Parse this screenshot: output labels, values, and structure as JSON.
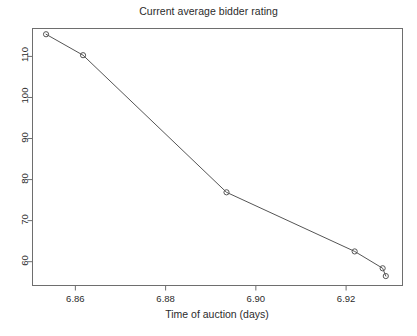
{
  "chart_data": {
    "type": "line",
    "title": "Current average bidder rating",
    "xlabel": "Time of auction (days)",
    "ylabel": "",
    "xlim": [
      6.8505,
      6.9325
    ],
    "ylim": [
      54.2,
      116.8
    ],
    "grid": false,
    "legend": null,
    "marker": "open-circle",
    "line_color": "#555555",
    "marker_color": "#555555",
    "x_ticks": [
      6.86,
      6.88,
      6.9,
      6.92
    ],
    "x_tick_labels": [
      "6.86",
      "6.88",
      "6.90",
      "6.92"
    ],
    "y_ticks": [
      60,
      70,
      80,
      90,
      100,
      110
    ],
    "y_tick_labels": [
      "60",
      "70",
      "80",
      "90",
      "100",
      "110"
    ],
    "series": [
      {
        "name": "Current average bidder rating",
        "x": [
          6.8535,
          6.8617,
          6.8935,
          6.9219,
          6.9281,
          6.9288
        ],
        "y": [
          115.4,
          110.3,
          76.9,
          62.5,
          58.4,
          56.5
        ]
      }
    ]
  },
  "figure": {
    "background_color": "#ffffff",
    "axis_color": "#6e6e6e",
    "text_color": "#2b2b2b"
  }
}
